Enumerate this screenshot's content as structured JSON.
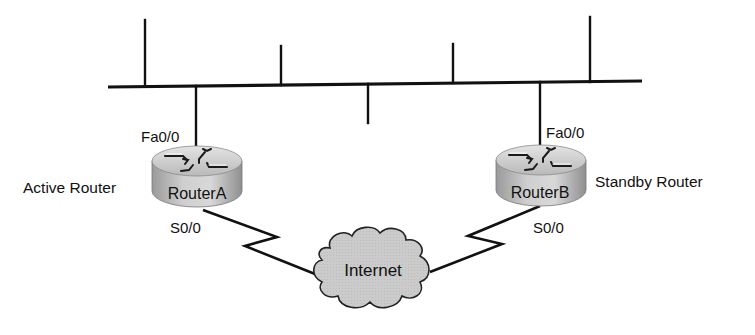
{
  "diagram": {
    "type": "network-topology",
    "lan": {
      "bus": {
        "x1": 108,
        "y1": 87,
        "x2": 642,
        "y2": 81
      },
      "host_drops": [
        {
          "x": 145,
          "y_top": 20,
          "dir": "up"
        },
        {
          "x": 281,
          "y_top": 46,
          "dir": "up"
        },
        {
          "x": 368,
          "y_bottom": 123,
          "dir": "down"
        },
        {
          "x": 453,
          "y_top": 44,
          "dir": "up"
        },
        {
          "x": 590,
          "y_top": 17,
          "dir": "up"
        }
      ]
    },
    "routers": [
      {
        "id": "routerA",
        "name": "RouterA",
        "role": "Active Router",
        "lan_interface": "Fa0/0",
        "wan_interface": "S0/0",
        "cx": 197,
        "top_y": 161
      },
      {
        "id": "routerB",
        "name": "RouterB",
        "role": "Standby Router",
        "lan_interface": "Fa0/0",
        "wan_interface": "S0/0",
        "cx": 540,
        "top_y": 160
      }
    ],
    "cloud": {
      "label": "Internet",
      "cx": 374,
      "cy": 270
    },
    "links": [
      {
        "from": "RouterA",
        "via": "S0/0",
        "to": "Internet",
        "type": "serial"
      },
      {
        "from": "RouterB",
        "via": "S0/0",
        "to": "Internet",
        "type": "serial"
      },
      {
        "from": "RouterA",
        "via": "Fa0/0",
        "to": "LAN",
        "type": "ethernet"
      },
      {
        "from": "RouterB",
        "via": "Fa0/0",
        "to": "LAN",
        "type": "ethernet"
      }
    ],
    "colors": {
      "line": "#111111",
      "router_fill_light": "#d9d9d9",
      "router_fill_dark": "#8c8c8c",
      "cloud_fill": "#c9c9c9",
      "background": "#ffffff"
    }
  }
}
